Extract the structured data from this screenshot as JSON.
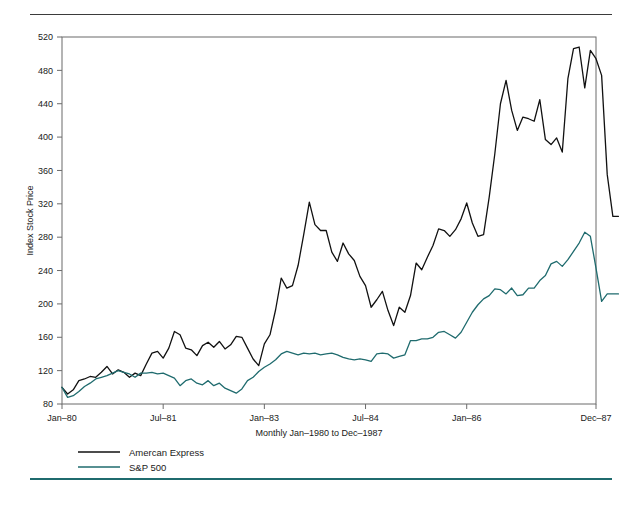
{
  "figure": {
    "top_rule_color": "#3b3b3b",
    "bottom_rule_color": "#1f6b6e",
    "background_color": "#ffffff"
  },
  "chart_data": {
    "type": "line",
    "title": "",
    "xlabel": "Monthly Jan–1980 to Dec–1987",
    "ylabel": "Index Stock Price",
    "ylim": [
      80,
      520
    ],
    "yticks": [
      80,
      120,
      160,
      200,
      240,
      280,
      320,
      360,
      400,
      440,
      480,
      520
    ],
    "ytick_labels": [
      "80",
      "120",
      "160",
      "200",
      "240",
      "280",
      "320",
      "360",
      "400",
      "440",
      "480",
      "520"
    ],
    "xlim": [
      0,
      95
    ],
    "xticks": [
      0,
      18,
      36,
      54,
      72,
      95
    ],
    "xtick_labels": [
      "Jan–80",
      "Jul–81",
      "Jan–83",
      "Jul–84",
      "Jan–86",
      "Dec–87"
    ],
    "grid": false,
    "legend_position": "below-left",
    "colors": {
      "amex": "#111111",
      "sp500": "#1f6b6e"
    },
    "series": [
      {
        "name": "Amercan Express",
        "color": "#111111",
        "values": [
          100,
          92,
          97,
          108,
          110,
          113,
          112,
          118,
          125,
          116,
          121,
          118,
          112,
          117,
          114,
          128,
          141,
          143,
          135,
          147,
          167,
          163,
          147,
          145,
          138,
          150,
          154,
          148,
          155,
          146,
          151,
          161,
          160,
          147,
          134,
          126,
          152,
          163,
          193,
          231,
          219,
          222,
          246,
          283,
          322,
          295,
          288,
          288,
          262,
          251,
          273,
          260,
          252,
          233,
          222,
          196,
          205,
          215,
          192,
          174,
          196,
          190,
          210,
          249,
          241,
          256,
          270,
          290,
          288,
          281,
          289,
          302,
          321,
          297,
          281,
          283,
          328,
          380,
          440,
          468,
          432,
          408,
          424,
          422,
          419,
          445,
          397,
          391,
          399,
          382,
          470,
          506,
          508,
          459,
          504,
          494,
          474,
          355,
          305,
          305
        ]
      },
      {
        "name": "S&P 500",
        "color": "#1f6b6e",
        "values": [
          100,
          88,
          90,
          95,
          101,
          105,
          110,
          112,
          114,
          117,
          120,
          118,
          116,
          112,
          117,
          117,
          118,
          116,
          117,
          114,
          111,
          102,
          108,
          110,
          105,
          103,
          108,
          102,
          105,
          99,
          96,
          93,
          98,
          108,
          112,
          119,
          124,
          128,
          133,
          140,
          143,
          141,
          139,
          141,
          140,
          141,
          139,
          140,
          141,
          139,
          136,
          134,
          133,
          134,
          133,
          131,
          140,
          141,
          140,
          135,
          137,
          139,
          156,
          156,
          158,
          158,
          160,
          166,
          167,
          163,
          159,
          166,
          178,
          190,
          199,
          206,
          210,
          218,
          217,
          212,
          219,
          210,
          211,
          219,
          219,
          228,
          234,
          248,
          251,
          245,
          253,
          263,
          273,
          286,
          281,
          243,
          203,
          212,
          212,
          212
        ]
      }
    ]
  },
  "legend": {
    "items": [
      {
        "label": "Amercan Express",
        "color": "#111111"
      },
      {
        "label": "S&P 500",
        "color": "#1f6b6e"
      }
    ]
  },
  "axes": {
    "y_title": "Index Stock Price",
    "x_title": "Monthly Jan–1980 to Dec–1987"
  }
}
